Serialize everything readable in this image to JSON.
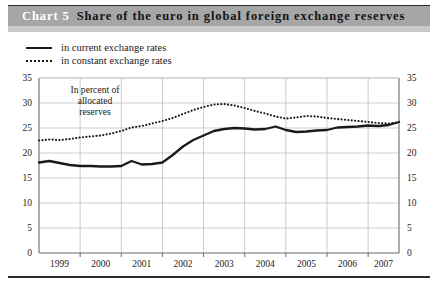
{
  "header": {
    "chart_number": "Chart 5",
    "title": "Share of the euro in global foreign exchange reserves"
  },
  "legend": {
    "items": [
      {
        "label": "in current exchange rates",
        "style": "solid"
      },
      {
        "label": "in constant exchange rates",
        "style": "dotted"
      }
    ]
  },
  "annotation": {
    "line1": "In percent of",
    "line2": "allocated",
    "line3": "reserves"
  },
  "axes": {
    "y_left_ticks": [
      "35",
      "30",
      "25",
      "20",
      "15",
      "10",
      "5",
      "0"
    ],
    "y_right_ticks": [
      "35",
      "30",
      "25",
      "20",
      "15",
      "10",
      "5",
      "0"
    ],
    "x_ticks": [
      "1999",
      "2000",
      "2001",
      "2002",
      "2003",
      "2004",
      "2005",
      "2006",
      "2007"
    ]
  },
  "colors": {
    "title_bar": "#a6a6a6",
    "title_number": "#ffffff",
    "title_text": "#141414",
    "line": "#1a1a1a",
    "grid": "#c0c0c0",
    "axis": "#6b6b6b",
    "background": "#ffffff"
  },
  "chart_data": {
    "type": "line",
    "title": "Share of the euro in global foreign exchange reserves",
    "xlabel": "",
    "ylabel": "In percent of allocated reserves",
    "ylim": [
      0,
      35
    ],
    "ytick_step": 5,
    "grid": true,
    "legend_position": "top-left",
    "annotation": "In percent of allocated reserves",
    "x": [
      "1999Q1",
      "1999Q2",
      "1999Q3",
      "1999Q4",
      "2000Q1",
      "2000Q2",
      "2000Q3",
      "2000Q4",
      "2001Q1",
      "2001Q2",
      "2001Q3",
      "2001Q4",
      "2002Q1",
      "2002Q2",
      "2002Q3",
      "2002Q4",
      "2003Q1",
      "2003Q2",
      "2003Q3",
      "2003Q4",
      "2004Q1",
      "2004Q2",
      "2004Q3",
      "2004Q4",
      "2005Q1",
      "2005Q2",
      "2005Q3",
      "2005Q4",
      "2006Q1",
      "2006Q2",
      "2006Q3",
      "2006Q4",
      "2007Q1",
      "2007Q2",
      "2007Q3",
      "2007Q4"
    ],
    "series": [
      {
        "name": "in current exchange rates",
        "style": "solid",
        "values": [
          18.1,
          18.4,
          18.0,
          17.6,
          17.4,
          17.4,
          17.3,
          17.3,
          17.4,
          18.4,
          17.7,
          17.8,
          18.1,
          19.6,
          21.3,
          22.6,
          23.5,
          24.4,
          24.8,
          25.0,
          24.9,
          24.7,
          24.8,
          25.3,
          24.6,
          24.2,
          24.3,
          24.5,
          24.6,
          25.1,
          25.2,
          25.3,
          25.5,
          25.4,
          25.6,
          26.2
        ]
      },
      {
        "name": "in constant exchange rates",
        "style": "dotted",
        "values": [
          22.5,
          22.7,
          22.6,
          22.8,
          23.1,
          23.3,
          23.5,
          23.9,
          24.4,
          25.1,
          25.4,
          25.9,
          26.4,
          27.0,
          27.8,
          28.6,
          29.2,
          29.7,
          29.8,
          29.5,
          29.0,
          28.4,
          27.9,
          27.3,
          26.9,
          27.1,
          27.4,
          27.3,
          27.0,
          26.8,
          26.6,
          26.4,
          26.2,
          26.0,
          25.9,
          26.1
        ]
      }
    ]
  }
}
